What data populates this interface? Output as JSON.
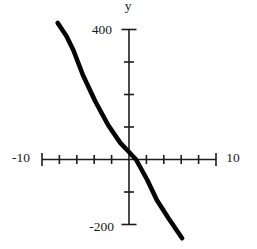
{
  "figure": {
    "background": "#ffffff",
    "axis_color": "#1c1c1c",
    "curve_color": "#050505"
  },
  "labels": {
    "y_axis_title": "y",
    "y_max": "400",
    "y_min": "-200",
    "x_min": "-10",
    "x_max": "10"
  },
  "chart_data": {
    "type": "line",
    "title": "",
    "xlabel": "",
    "ylabel": "y",
    "xlim": [
      -10,
      10
    ],
    "ylim": [
      -200,
      400
    ],
    "x_tick_step": 2,
    "y_tick_step": 100,
    "x_axis_labeled_ticks": [
      -10,
      10
    ],
    "y_axis_labeled_ticks": [
      400,
      -200
    ],
    "grid": false,
    "legend": null,
    "series": [
      {
        "name": "plotted-line",
        "style": "thick solid black hand-drawn line, negative slope, approx y = -46x + 25",
        "points": [
          [
            -8.2,
            420
          ],
          [
            -7.2,
            380
          ],
          [
            -6.4,
            337
          ],
          [
            -5.3,
            260
          ],
          [
            -3.9,
            180
          ],
          [
            -2.4,
            106
          ],
          [
            -1.0,
            51
          ],
          [
            0.0,
            23
          ],
          [
            0.8,
            0
          ],
          [
            2.1,
            -63
          ],
          [
            3.2,
            -125
          ],
          [
            4.6,
            -183
          ],
          [
            6.1,
            -242
          ]
        ]
      }
    ]
  }
}
